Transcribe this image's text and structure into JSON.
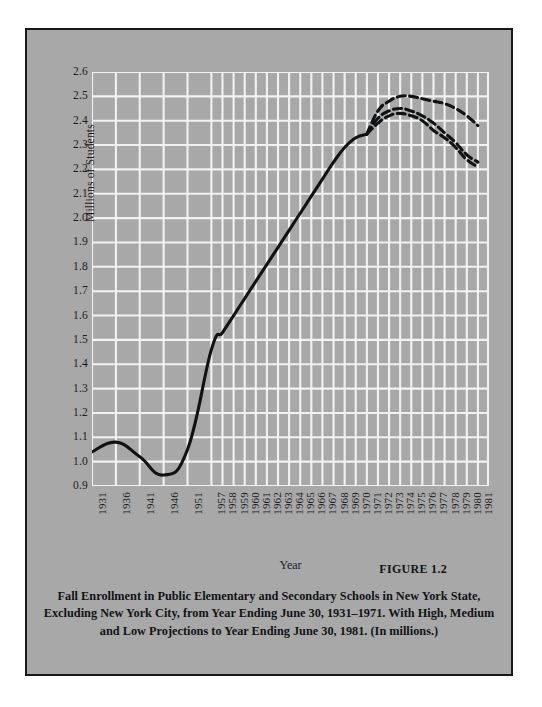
{
  "figure": {
    "number_label": "FIGURE 1.2",
    "caption_lines": [
      "Fall Enrollment in Public Elementary and Secondary Schools in New York State,",
      "Excluding New York City, from Year Ending June 30, 1931–1971. With High, Medium",
      "and Low Projections to Year Ending June 30, 1981. (In millions.)"
    ]
  },
  "colors": {
    "panel_background": "#a8a8a8",
    "grid": "#f2f2f2",
    "series_line": "#101214",
    "frame_border": "#16181c",
    "text": "#1a1c20"
  },
  "chart_data": {
    "type": "line",
    "title": "",
    "xlabel": "Year",
    "ylabel": "Millions of Students",
    "ylim": [
      0.9,
      2.6
    ],
    "ytick_labels": [
      "2.6",
      "2.5",
      "2.4",
      "2.3",
      "2.2",
      "2.1",
      "2.0",
      "1.9",
      "1.8",
      "1.7",
      "1.6",
      "1.5",
      "1.4",
      "1.3",
      "1.2",
      "1.1",
      "1.0",
      "0.9"
    ],
    "ytick_values": [
      2.6,
      2.5,
      2.4,
      2.3,
      2.2,
      2.1,
      2.0,
      1.9,
      1.8,
      1.7,
      1.6,
      1.5,
      1.4,
      1.3,
      1.2,
      1.1,
      1.0,
      0.9
    ],
    "xtick_labels": [
      "1931",
      "1936",
      "1941",
      "1946",
      "1951",
      "1957",
      "1958",
      "1959",
      "1960",
      "1961",
      "1962",
      "1963",
      "1964",
      "1965",
      "1966",
      "1967",
      "1968",
      "1969",
      "1970",
      "1971",
      "1972",
      "1973",
      "1974",
      "1975",
      "1976",
      "1977",
      "1978",
      "1979",
      "1980",
      "1981"
    ],
    "grid": true,
    "legend_position": "none",
    "series": [
      {
        "name": "Actual Enrollment",
        "style": "solid",
        "x": [
          "1931",
          "1936",
          "1941",
          "1946",
          "1951",
          "1957",
          "1958",
          "1959",
          "1960",
          "1961",
          "1962",
          "1963",
          "1964",
          "1965",
          "1966",
          "1967",
          "1968",
          "1969",
          "1970",
          "1971"
        ],
        "values": [
          1.04,
          1.08,
          1.02,
          0.945,
          1.05,
          1.46,
          1.53,
          1.6,
          1.67,
          1.74,
          1.81,
          1.88,
          1.95,
          2.02,
          2.09,
          2.16,
          2.23,
          2.29,
          2.33,
          2.345
        ]
      },
      {
        "name": "High Projection",
        "style": "dashed",
        "x": [
          "1971",
          "1972",
          "1973",
          "1974",
          "1975",
          "1976",
          "1977",
          "1978",
          "1979",
          "1980",
          "1981"
        ],
        "values": [
          2.345,
          2.44,
          2.48,
          2.5,
          2.5,
          2.49,
          2.48,
          2.47,
          2.45,
          2.42,
          2.38
        ]
      },
      {
        "name": "Medium Projection",
        "style": "dashed",
        "x": [
          "1971",
          "1972",
          "1973",
          "1974",
          "1975",
          "1976",
          "1977",
          "1978",
          "1979",
          "1980",
          "1981"
        ],
        "values": [
          2.345,
          2.41,
          2.44,
          2.45,
          2.44,
          2.42,
          2.39,
          2.35,
          2.31,
          2.26,
          2.23
        ]
      },
      {
        "name": "Low Projection",
        "style": "dashed",
        "x": [
          "1971",
          "1972",
          "1973",
          "1974",
          "1975",
          "1976",
          "1977",
          "1978",
          "1979",
          "1980",
          "1981"
        ],
        "values": [
          2.345,
          2.39,
          2.42,
          2.43,
          2.42,
          2.4,
          2.36,
          2.33,
          2.29,
          2.24,
          2.21
        ]
      }
    ]
  }
}
